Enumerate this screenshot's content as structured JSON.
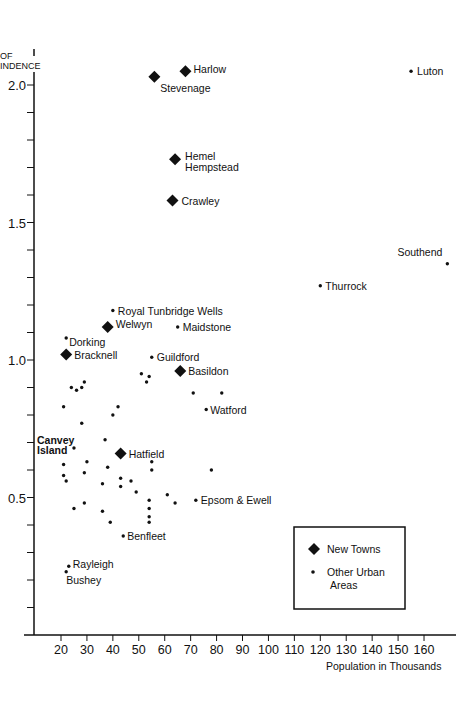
{
  "chart_data": {
    "type": "scatter",
    "title": "",
    "ylabel": "INDEX OF INDEPENDENCE",
    "ylabel_visible": "OF\nINDENCE",
    "xlabel": "Population in Thousands",
    "xlim": [
      10,
      165
    ],
    "ylim": [
      0,
      2.1
    ],
    "x_ticks": [
      20,
      30,
      40,
      50,
      60,
      70,
      80,
      90,
      100,
      110,
      120,
      130,
      140,
      150,
      160
    ],
    "y_ticks": [
      0.5,
      1.0,
      1.5,
      2.0
    ],
    "y_tick_labels": [
      "0.5",
      "1.0",
      "1.5",
      "2.0"
    ],
    "grid": false,
    "legend": {
      "position": "lower right",
      "entries": [
        {
          "marker": "diamond",
          "label": "New Towns"
        },
        {
          "marker": "dot",
          "label": "Other Urban Areas"
        }
      ]
    },
    "series": [
      {
        "name": "New Towns",
        "marker": "diamond",
        "points": [
          {
            "label": "Harlow",
            "x": 68,
            "y": 2.05
          },
          {
            "label": "Stevenage",
            "x": 56,
            "y": 2.03
          },
          {
            "label": "Hemel Hempstead",
            "x": 64,
            "y": 1.73
          },
          {
            "label": "Crawley",
            "x": 63,
            "y": 1.58
          },
          {
            "label": "Welwyn",
            "x": 38,
            "y": 1.12
          },
          {
            "label": "Bracknell",
            "x": 22,
            "y": 1.02
          },
          {
            "label": "Basildon",
            "x": 66,
            "y": 0.96
          },
          {
            "label": "Hatfield",
            "x": 43,
            "y": 0.66
          }
        ]
      },
      {
        "name": "Other Urban Areas",
        "marker": "dot",
        "points": [
          {
            "label": "Luton",
            "x": 155,
            "y": 2.05
          },
          {
            "label": "Southend",
            "x": 169,
            "y": 1.35
          },
          {
            "label": "Thurrock",
            "x": 120,
            "y": 1.27
          },
          {
            "label": "Royal Tunbridge Wells",
            "x": 40,
            "y": 1.18
          },
          {
            "label": "Maidstone",
            "x": 65,
            "y": 1.12
          },
          {
            "label": "Dorking",
            "x": 22,
            "y": 1.08
          },
          {
            "label": "Guildford",
            "x": 55,
            "y": 1.01
          },
          {
            "label": "Watford",
            "x": 76,
            "y": 0.82
          },
          {
            "label": "Canvey Island",
            "x": 25,
            "y": 0.68
          },
          {
            "label": "Epsom & Ewell",
            "x": 72,
            "y": 0.49
          },
          {
            "label": "Benfleet",
            "x": 44,
            "y": 0.36
          },
          {
            "label": "Rayleigh",
            "x": 23,
            "y": 0.25
          },
          {
            "label": "Bushey",
            "x": 22,
            "y": 0.23
          },
          {
            "label": "",
            "x": 24,
            "y": 0.9
          },
          {
            "label": "",
            "x": 26,
            "y": 0.89
          },
          {
            "label": "",
            "x": 28,
            "y": 0.9
          },
          {
            "label": "",
            "x": 29,
            "y": 0.92
          },
          {
            "label": "",
            "x": 51,
            "y": 0.95
          },
          {
            "label": "",
            "x": 54,
            "y": 0.94
          },
          {
            "label": "",
            "x": 53,
            "y": 0.92
          },
          {
            "label": "",
            "x": 71,
            "y": 0.88
          },
          {
            "label": "",
            "x": 82,
            "y": 0.88
          },
          {
            "label": "",
            "x": 21,
            "y": 0.83
          },
          {
            "label": "",
            "x": 40,
            "y": 0.8
          },
          {
            "label": "",
            "x": 42,
            "y": 0.83
          },
          {
            "label": "",
            "x": 28,
            "y": 0.77
          },
          {
            "label": "",
            "x": 37,
            "y": 0.71
          },
          {
            "label": "",
            "x": 55,
            "y": 0.63
          },
          {
            "label": "",
            "x": 21,
            "y": 0.62
          },
          {
            "label": "",
            "x": 30,
            "y": 0.63
          },
          {
            "label": "",
            "x": 38,
            "y": 0.61
          },
          {
            "label": "",
            "x": 55,
            "y": 0.6
          },
          {
            "label": "",
            "x": 78,
            "y": 0.6
          },
          {
            "label": "",
            "x": 21,
            "y": 0.58
          },
          {
            "label": "",
            "x": 22,
            "y": 0.56
          },
          {
            "label": "",
            "x": 29,
            "y": 0.59
          },
          {
            "label": "",
            "x": 36,
            "y": 0.55
          },
          {
            "label": "",
            "x": 43,
            "y": 0.57
          },
          {
            "label": "",
            "x": 47,
            "y": 0.56
          },
          {
            "label": "",
            "x": 43,
            "y": 0.54
          },
          {
            "label": "",
            "x": 49,
            "y": 0.52
          },
          {
            "label": "",
            "x": 61,
            "y": 0.51
          },
          {
            "label": "",
            "x": 54,
            "y": 0.49
          },
          {
            "label": "",
            "x": 64,
            "y": 0.48
          },
          {
            "label": "",
            "x": 29,
            "y": 0.48
          },
          {
            "label": "",
            "x": 25,
            "y": 0.46
          },
          {
            "label": "",
            "x": 54,
            "y": 0.46
          },
          {
            "label": "",
            "x": 36,
            "y": 0.45
          },
          {
            "label": "",
            "x": 54,
            "y": 0.43
          },
          {
            "label": "",
            "x": 39,
            "y": 0.41
          },
          {
            "label": "",
            "x": 54,
            "y": 0.41
          }
        ]
      }
    ]
  },
  "axes": {
    "ylabel_line1": "OF",
    "ylabel_line2": "INDENCE",
    "xlabel": "Population in Thousands"
  },
  "legend": {
    "new_towns": "New Towns",
    "other_line1": "Other Urban",
    "other_line2": "Areas"
  }
}
